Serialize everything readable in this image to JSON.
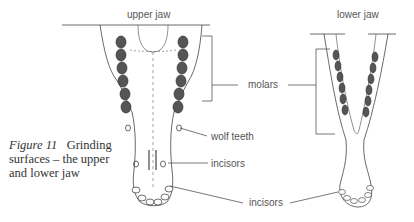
{
  "figure": {
    "number_label": "Figure 11",
    "caption": "Grinding surfaces – the upper and lower jaw",
    "caption_line1_rest": "Grinding",
    "caption_line2": "surfaces – the upper",
    "caption_line3": "and lower jaw"
  },
  "labels": {
    "upper_jaw": "upper jaw",
    "lower_jaw": "lower jaw",
    "molars": "molars",
    "wolf_teeth": "wolf teeth",
    "incisors_upper": "incisors",
    "incisors_lower": "incisors"
  },
  "colors": {
    "ink": "#333333",
    "label": "#555555",
    "background": "#ffffff"
  }
}
